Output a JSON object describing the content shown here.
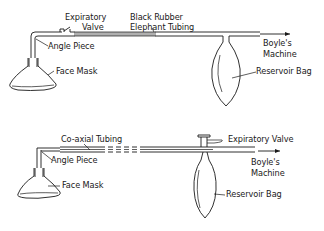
{
  "diagram": {
    "top_circuit": {
      "labels": {
        "expiratory_valve_line1": "Expiratory",
        "expiratory_valve_line2": "Valve",
        "tubing_line1": "Black Rubber",
        "tubing_line2": "Elephant Tubing",
        "angle_piece": "Angle Piece",
        "face_mask": "Face Mask",
        "machine_line1": "Boyle's",
        "machine_line2": "Machine",
        "reservoir_bag": "Reservoir Bag"
      }
    },
    "bottom_circuit": {
      "labels": {
        "coaxial_tubing": "Co-axial Tubing",
        "expiratory_valve": "Expiratory Valve",
        "angle_piece": "Angle Piece",
        "face_mask": "Face Mask",
        "machine_line1": "Boyle's",
        "machine_line2": "Machine",
        "reservoir_bag": "Reservoir Bag"
      }
    },
    "colors": {
      "ink": "#1a1a1a",
      "background": "#ffffff"
    }
  }
}
